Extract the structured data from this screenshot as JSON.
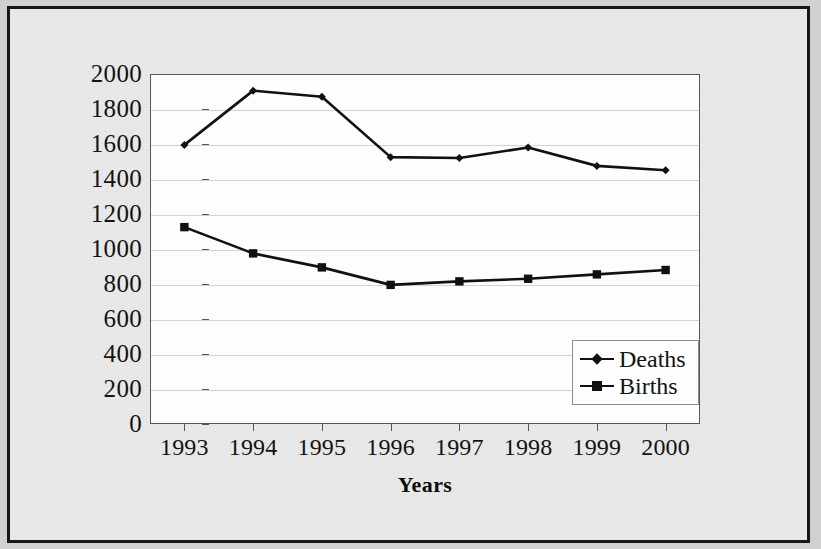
{
  "chart_data": {
    "type": "line",
    "title": "",
    "xlabel": "Years",
    "ylabel": "",
    "categories": [
      "1993",
      "1994",
      "1995",
      "1996",
      "1997",
      "1998",
      "1999",
      "2000"
    ],
    "series": [
      {
        "name": "Deaths",
        "marker": "diamond",
        "color": "#111111",
        "values": [
          1595,
          1905,
          1870,
          1525,
          1520,
          1580,
          1475,
          1450
        ]
      },
      {
        "name": "Births",
        "marker": "square",
        "color": "#111111",
        "values": [
          1125,
          975,
          895,
          795,
          815,
          830,
          855,
          880
        ]
      }
    ],
    "ylim": [
      0,
      2000
    ],
    "y_ticks": [
      "0",
      "200",
      "400",
      "600",
      "800",
      "1000",
      "1200",
      "1400",
      "1600",
      "1800",
      "2000"
    ],
    "y_tick_values": [
      0,
      200,
      400,
      600,
      800,
      1000,
      1200,
      1400,
      1600,
      1800,
      2000
    ],
    "grid": true,
    "legend_position": "inside-lower-right"
  },
  "legend": {
    "entries": [
      {
        "label": "Deaths"
      },
      {
        "label": "Births"
      }
    ]
  },
  "axes": {
    "x_title": "Years"
  }
}
